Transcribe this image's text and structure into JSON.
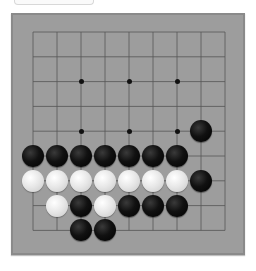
{
  "game": {
    "type": "go/gomoku board",
    "grid_size": 9,
    "colors": {
      "board": "#9d9d9d",
      "line": "#555555",
      "black": "#000000",
      "white": "#e6e6e6"
    },
    "star_points": [
      [
        2,
        2
      ],
      [
        4,
        2
      ],
      [
        6,
        2
      ],
      [
        2,
        4
      ],
      [
        4,
        4
      ],
      [
        6,
        4
      ]
    ],
    "stones": [
      {
        "col": 7,
        "row": 4,
        "color": "black"
      },
      {
        "col": 0,
        "row": 5,
        "color": "black"
      },
      {
        "col": 1,
        "row": 5,
        "color": "black"
      },
      {
        "col": 2,
        "row": 5,
        "color": "black"
      },
      {
        "col": 3,
        "row": 5,
        "color": "black"
      },
      {
        "col": 4,
        "row": 5,
        "color": "black"
      },
      {
        "col": 5,
        "row": 5,
        "color": "black"
      },
      {
        "col": 6,
        "row": 5,
        "color": "black"
      },
      {
        "col": 0,
        "row": 6,
        "color": "white"
      },
      {
        "col": 1,
        "row": 6,
        "color": "white"
      },
      {
        "col": 2,
        "row": 6,
        "color": "white"
      },
      {
        "col": 3,
        "row": 6,
        "color": "white"
      },
      {
        "col": 4,
        "row": 6,
        "color": "white"
      },
      {
        "col": 5,
        "row": 6,
        "color": "white"
      },
      {
        "col": 6,
        "row": 6,
        "color": "white"
      },
      {
        "col": 7,
        "row": 6,
        "color": "black"
      },
      {
        "col": 1,
        "row": 7,
        "color": "white"
      },
      {
        "col": 2,
        "row": 7,
        "color": "black"
      },
      {
        "col": 3,
        "row": 7,
        "color": "white"
      },
      {
        "col": 4,
        "row": 7,
        "color": "black"
      },
      {
        "col": 5,
        "row": 7,
        "color": "black"
      },
      {
        "col": 6,
        "row": 7,
        "color": "black"
      },
      {
        "col": 2,
        "row": 8,
        "color": "black"
      },
      {
        "col": 3,
        "row": 8,
        "color": "black"
      }
    ]
  }
}
